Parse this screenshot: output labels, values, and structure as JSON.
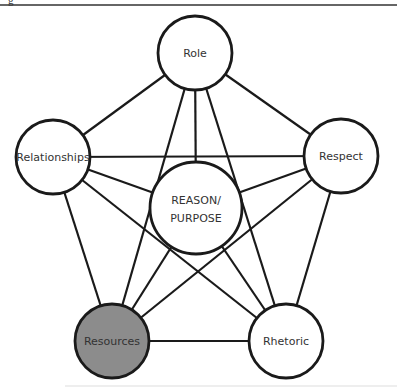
{
  "figure": {
    "caption_fragment": "g",
    "top_rule_color": "#333333",
    "bottom_rule_color": "#dddddd",
    "line_color": "#1a1a1a",
    "node_stroke": "#1a1a1a",
    "highlight_fill": "#8c8c8c",
    "nodes": [
      {
        "id": "role",
        "label": "Role",
        "cx": 195,
        "cy": 53,
        "r": 37,
        "fill": "#ffffff"
      },
      {
        "id": "relationships",
        "label": "Relationships",
        "cx": 53,
        "cy": 157,
        "r": 37,
        "fill": "#ffffff"
      },
      {
        "id": "respect",
        "label": "Respect",
        "cx": 341,
        "cy": 156,
        "r": 37,
        "fill": "#ffffff"
      },
      {
        "id": "resources",
        "label": "Resources",
        "cx": 112,
        "cy": 341,
        "r": 37,
        "fill": "#8c8c8c"
      },
      {
        "id": "rhetoric",
        "label": "Rhetoric",
        "cx": 286,
        "cy": 341,
        "r": 37,
        "fill": "#ffffff"
      },
      {
        "id": "center",
        "label_line1": "REASON/",
        "label_line2": "PURPOSE",
        "cx": 196,
        "cy": 208,
        "r": 46,
        "fill": "#ffffff"
      }
    ],
    "edges": [
      [
        "role",
        "relationships"
      ],
      [
        "role",
        "respect"
      ],
      [
        "role",
        "resources"
      ],
      [
        "role",
        "rhetoric"
      ],
      [
        "role",
        "center"
      ],
      [
        "relationships",
        "respect"
      ],
      [
        "relationships",
        "resources"
      ],
      [
        "relationships",
        "rhetoric"
      ],
      [
        "relationships",
        "center"
      ],
      [
        "respect",
        "resources"
      ],
      [
        "respect",
        "rhetoric"
      ],
      [
        "respect",
        "center"
      ],
      [
        "resources",
        "rhetoric"
      ],
      [
        "resources",
        "center"
      ],
      [
        "rhetoric",
        "center"
      ]
    ]
  }
}
